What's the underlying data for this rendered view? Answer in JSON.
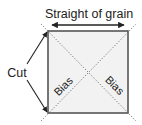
{
  "diagram": {
    "title_label": "Straight of grain",
    "cut_label": "Cut",
    "bias_left_label": "Bias",
    "bias_right_label": "Bias",
    "colors": {
      "square_fill": "#f2f2f2",
      "square_border": "#555555",
      "arrows": "#222222",
      "diagonals": "#666666",
      "text": "#222222"
    }
  }
}
